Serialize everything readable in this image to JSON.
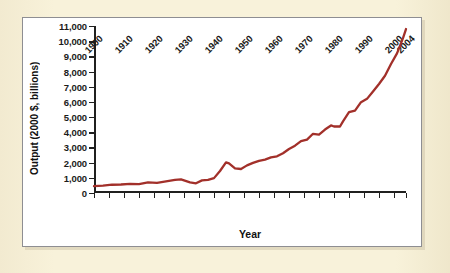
{
  "figure": {
    "background_color": "#f7f0d6",
    "card_background": "#ffffff",
    "card_border_color": "#8e8e92",
    "line_color": "#a2302a",
    "axis_color": "#20201f"
  },
  "chart_data": {
    "type": "line",
    "title": "",
    "xlabel": "Year",
    "ylabel": "Output (2000 $, billions)",
    "xlim": [
      1900,
      2004
    ],
    "ylim": [
      0,
      11000
    ],
    "grid": false,
    "legend": null,
    "y_ticks": [
      0,
      1000,
      2000,
      3000,
      4000,
      5000,
      6000,
      7000,
      8000,
      9000,
      10000,
      11000
    ],
    "y_tick_labels": [
      "0",
      "1,000",
      "2,000",
      "3,000",
      "4,000",
      "5,000",
      "6,000",
      "7,000",
      "8,000",
      "9,000",
      "10,000",
      "11,000"
    ],
    "x_ticks": [
      1900,
      1905,
      1910,
      1915,
      1920,
      1925,
      1930,
      1935,
      1940,
      1945,
      1950,
      1955,
      1960,
      1965,
      1970,
      1975,
      1980,
      1985,
      1990,
      1995,
      2000,
      2004
    ],
    "x_tick_labels": [
      {
        "value": 1900,
        "label": "1900"
      },
      {
        "value": 1905,
        "label": ""
      },
      {
        "value": 1910,
        "label": "1910"
      },
      {
        "value": 1915,
        "label": ""
      },
      {
        "value": 1920,
        "label": "1920"
      },
      {
        "value": 1925,
        "label": ""
      },
      {
        "value": 1930,
        "label": "1930"
      },
      {
        "value": 1935,
        "label": ""
      },
      {
        "value": 1940,
        "label": "1940"
      },
      {
        "value": 1945,
        "label": ""
      },
      {
        "value": 1950,
        "label": "1950"
      },
      {
        "value": 1955,
        "label": ""
      },
      {
        "value": 1960,
        "label": "1960"
      },
      {
        "value": 1965,
        "label": ""
      },
      {
        "value": 1970,
        "label": "1970"
      },
      {
        "value": 1975,
        "label": ""
      },
      {
        "value": 1980,
        "label": "1980"
      },
      {
        "value": 1985,
        "label": ""
      },
      {
        "value": 1990,
        "label": "1990"
      },
      {
        "value": 1995,
        "label": ""
      },
      {
        "value": 2000,
        "label": "2000"
      },
      {
        "value": 2004,
        "label": "2004"
      }
    ],
    "series": [
      {
        "name": "Real output",
        "color": "#a2302a",
        "x": [
          1900,
          1901,
          1902,
          1903,
          1904,
          1905,
          1906,
          1907,
          1908,
          1909,
          1910,
          1911,
          1912,
          1913,
          1914,
          1915,
          1916,
          1917,
          1918,
          1919,
          1920,
          1921,
          1922,
          1923,
          1924,
          1925,
          1926,
          1927,
          1928,
          1929,
          1930,
          1931,
          1932,
          1933,
          1934,
          1935,
          1936,
          1937,
          1938,
          1939,
          1940,
          1941,
          1942,
          1943,
          1944,
          1945,
          1946,
          1947,
          1948,
          1949,
          1950,
          1951,
          1952,
          1953,
          1954,
          1955,
          1956,
          1957,
          1958,
          1959,
          1960,
          1961,
          1962,
          1963,
          1964,
          1965,
          1966,
          1967,
          1968,
          1969,
          1970,
          1971,
          1972,
          1973,
          1974,
          1975,
          1976,
          1977,
          1978,
          1979,
          1980,
          1981,
          1982,
          1983,
          1984,
          1985,
          1986,
          1987,
          1988,
          1989,
          1990,
          1991,
          1992,
          1993,
          1994,
          1995,
          1996,
          1997,
          1998,
          1999,
          2000,
          2001,
          2002,
          2003,
          2004
        ],
        "y": [
          450,
          460,
          480,
          495,
          490,
          520,
          555,
          560,
          525,
          580,
          590,
          600,
          625,
          645,
          600,
          615,
          700,
          690,
          740,
          745,
          735,
          720,
          760,
          855,
          880,
          930,
          985,
          995,
          1010,
          1060,
          965,
          900,
          785,
          770,
          850,
          965,
          1090,
          1145,
          1100,
          1185,
          1285,
          1510,
          1790,
          2090,
          2250,
          2225,
          1965,
          1950,
          2030,
          2020,
          2200,
          2375,
          2470,
          2585,
          2565,
          2745,
          2805,
          2860,
          2835,
          3030,
          3110,
          3185,
          3375,
          3525,
          3725,
          3965,
          4230,
          4340,
          4545,
          4685,
          4690,
          4840,
          5100,
          5390,
          5360,
          5350,
          5640,
          5900,
          6230,
          6430,
          6410,
          6570,
          6440,
          6740,
          7230,
          7530,
          7790,
          8060,
          8390,
          8680,
          8840,
          8830,
          9130,
          9380,
          9770,
          10000,
          10390,
          10860,
          11340,
          11890,
          12340,
          12460,
          12680,
          13020,
          13500
        ],
        "y_note": "Values are rendered scaled to the chart's 0-11,000 axis reading"
      }
    ],
    "plot_points_axis_units": {
      "x": [
        1900,
        1903,
        1906,
        1909,
        1912,
        1915,
        1918,
        1921,
        1924,
        1927,
        1929,
        1932,
        1934,
        1936,
        1938,
        1940,
        1942,
        1944,
        1945,
        1947,
        1949,
        1951,
        1953,
        1955,
        1957,
        1959,
        1961,
        1963,
        1965,
        1967,
        1969,
        1971,
        1973,
        1975,
        1977,
        1979,
        1980,
        1982,
        1983,
        1985,
        1987,
        1989,
        1991,
        1993,
        1995,
        1997,
        1999,
        2001,
        2003,
        2004
      ],
      "y": [
        450,
        480,
        545,
        560,
        600,
        590,
        700,
        670,
        760,
        860,
        900,
        700,
        640,
        830,
        860,
        980,
        1450,
        2020,
        1950,
        1620,
        1580,
        1820,
        1980,
        2120,
        2200,
        2350,
        2420,
        2620,
        2900,
        3120,
        3420,
        3520,
        3900,
        3840,
        4180,
        4450,
        4380,
        4380,
        4720,
        5320,
        5420,
        5980,
        6200,
        6680,
        7180,
        7720,
        8500,
        9200,
        10200,
        10800
      ]
    }
  },
  "axis_titles": {
    "y": "Output (2000 $, billions)",
    "x": "Year"
  }
}
